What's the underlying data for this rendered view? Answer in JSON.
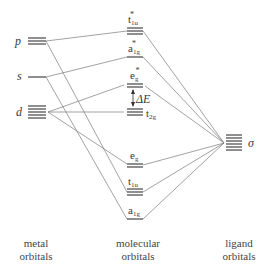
{
  "diagram": {
    "type": "molecular-orbital-diagram",
    "metal_orbitals": [
      {
        "label": "p",
        "degeneracy": 3
      },
      {
        "label": "s",
        "degeneracy": 1
      },
      {
        "label": "d",
        "degeneracy": 5
      }
    ],
    "molecular_orbitals": [
      {
        "label": "t",
        "sub": "1u",
        "star": "*",
        "degeneracy": 3
      },
      {
        "label": "a",
        "sub": "1g",
        "star": "*",
        "degeneracy": 1
      },
      {
        "label": "e",
        "sub": "g",
        "star": "*",
        "degeneracy": 2
      },
      {
        "label": "t",
        "sub": "2g",
        "star": "",
        "degeneracy": 3
      },
      {
        "label": "e",
        "sub": "g",
        "star": "",
        "degeneracy": 2
      },
      {
        "label": "t",
        "sub": "1u",
        "star": "",
        "degeneracy": 3
      },
      {
        "label": "a",
        "sub": "1g",
        "star": "",
        "degeneracy": 1
      }
    ],
    "ligand_orbitals": [
      {
        "label": "σ",
        "degeneracy": 6
      }
    ],
    "splitting_label": "ΔE",
    "column_labels": {
      "metal_line1": "metal",
      "metal_line2": "orbitals",
      "mo_line1": "molecular",
      "mo_line2": "orbitals",
      "ligand_line1": "ligand",
      "ligand_line2": "orbitals"
    },
    "colors": {
      "line": "#555555",
      "level": "#333333",
      "text": "#3a3a3a"
    }
  }
}
